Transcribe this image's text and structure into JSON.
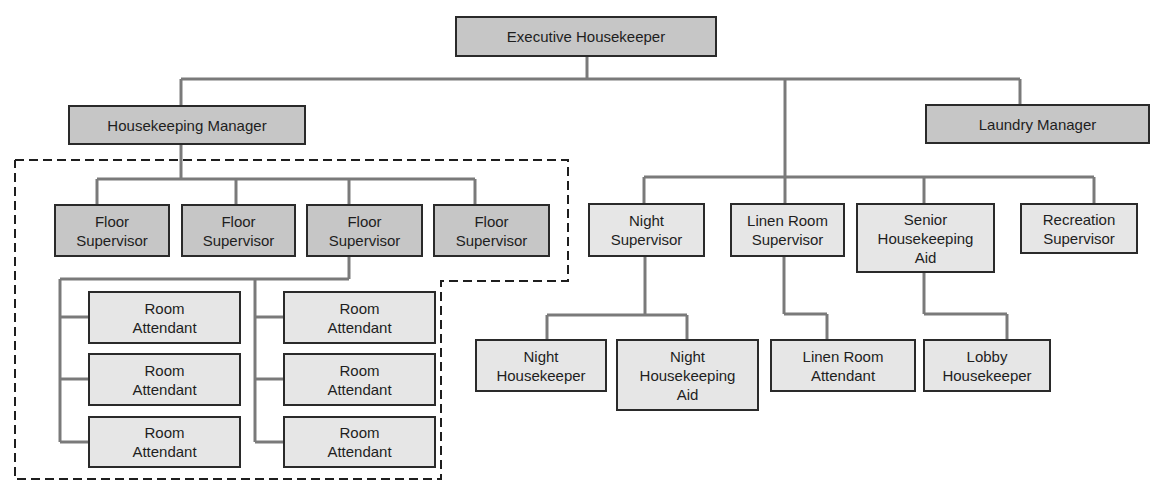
{
  "diagram": {
    "type": "org-chart",
    "colors": {
      "primary_fill": "#c6c6c6",
      "secondary_fill": "#e6e6e6",
      "border": "#2a2a2a",
      "connector": "#7a7a7a"
    },
    "nodes": {
      "executive_housekeeper": "Executive Housekeeper",
      "housekeeping_manager": "Housekeeping Manager",
      "laundry_manager": "Laundry Manager",
      "floor_supervisor_1": "Floor\nSupervisor",
      "floor_supervisor_2": "Floor\nSupervisor",
      "floor_supervisor_3": "Floor\nSupervisor",
      "floor_supervisor_4": "Floor\nSupervisor",
      "room_attendant_1": "Room\nAttendant",
      "room_attendant_2": "Room\nAttendant",
      "room_attendant_3": "Room\nAttendant",
      "room_attendant_4": "Room\nAttendant",
      "room_attendant_5": "Room\nAttendant",
      "room_attendant_6": "Room\nAttendant",
      "night_supervisor": "Night\nSupervisor",
      "linen_room_supervisor": "Linen Room\nSupervisor",
      "senior_housekeeping_aid": "Senior\nHousekeeping\nAid",
      "recreation_supervisor": "Recreation\nSupervisor",
      "night_housekeeper": "Night\nHousekeeper",
      "night_housekeeping_aid": "Night\nHousekeeping\nAid",
      "linen_room_attendant": "Linen Room\nAttendant",
      "lobby_housekeeper": "Lobby\nHousekeeper"
    },
    "edges": [
      [
        "Executive Housekeeper",
        "Housekeeping Manager"
      ],
      [
        "Executive Housekeeper",
        "Laundry Manager"
      ],
      [
        "Executive Housekeeper",
        "Night Supervisor"
      ],
      [
        "Executive Housekeeper",
        "Linen Room Supervisor"
      ],
      [
        "Executive Housekeeper",
        "Senior Housekeeping Aid"
      ],
      [
        "Executive Housekeeper",
        "Recreation Supervisor"
      ],
      [
        "Housekeeping Manager",
        "Floor Supervisor x4"
      ],
      [
        "Floor Supervisor (3rd)",
        "Room Attendant x6"
      ],
      [
        "Night Supervisor",
        "Night Housekeeper"
      ],
      [
        "Night Supervisor",
        "Night Housekeeping Aid"
      ],
      [
        "Linen Room Supervisor",
        "Linen Room Attendant"
      ],
      [
        "Senior Housekeeping Aid",
        "Lobby Housekeeper"
      ]
    ]
  }
}
